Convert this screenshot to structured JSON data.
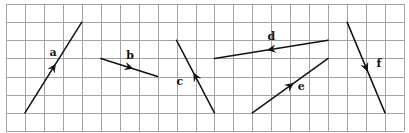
{
  "diagram": {
    "type": "vectors-on-grid",
    "grid": {
      "columns": 21,
      "rows": 7,
      "origin_px": [
        6,
        4
      ],
      "cell_w": 18.95,
      "cell_h": 18.14,
      "line_color": "#a3a3a3"
    },
    "vector_color": "#111111",
    "vectors": [
      {
        "label": "a",
        "from": [
          1,
          6
        ],
        "to": [
          4,
          1
        ],
        "label_pos": [
          2.3,
          2.85
        ]
      },
      {
        "label": "b",
        "from": [
          5,
          3
        ],
        "to": [
          8,
          4
        ],
        "label_pos": [
          6.35,
          3.05
        ]
      },
      {
        "label": "c",
        "from": [
          11,
          6
        ],
        "to": [
          9,
          2
        ],
        "label_pos": [
          9.0,
          4.45
        ]
      },
      {
        "label": "d",
        "from": [
          17,
          2
        ],
        "to": [
          11,
          3
        ],
        "label_pos": [
          13.8,
          2.0
        ]
      },
      {
        "label": "e",
        "from": [
          13,
          6
        ],
        "to": [
          17,
          3
        ],
        "label_pos": [
          15.4,
          4.75
        ]
      },
      {
        "label": "f",
        "from": [
          18,
          1
        ],
        "to": [
          20,
          6
        ],
        "label_pos": [
          19.55,
          3.5
        ]
      }
    ]
  }
}
